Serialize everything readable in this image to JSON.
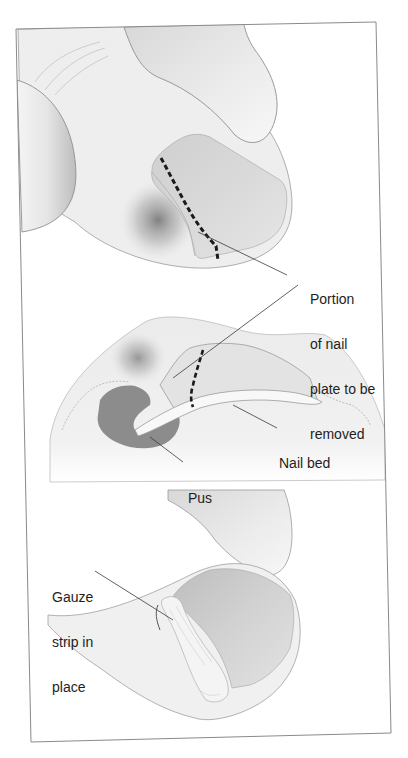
{
  "figure": {
    "type": "medical-illustration",
    "panels": [
      {
        "id": "top",
        "description": "Toe with ingrown nail, dashed line marking cut",
        "labels": []
      },
      {
        "id": "middle",
        "description": "Cross-section showing nail plate, nail bed and pus pocket",
        "labels": [
          "nail_bed",
          "pus"
        ]
      },
      {
        "id": "bottom",
        "description": "Toe after removal with gauze strip inserted",
        "labels": [
          "gauze"
        ]
      }
    ],
    "colors": {
      "frame": "#8a8a8a",
      "outline": "#9a9a9a",
      "skin": "#efefef",
      "nail": "#cfcfcf",
      "pus": "#8c8c8c",
      "dashed_line": "#1a1a1a",
      "leader": "#3a3a3a",
      "text": "#1e1e1e"
    }
  },
  "labels": {
    "portion": {
      "lines": [
        "Portion",
        "of nail",
        "plate to be",
        "removed"
      ]
    },
    "nail_bed": {
      "text": "Nail bed"
    },
    "pus": {
      "text": "Pus"
    },
    "gauze": {
      "lines": [
        "Gauze",
        "strip in",
        "place"
      ]
    }
  }
}
